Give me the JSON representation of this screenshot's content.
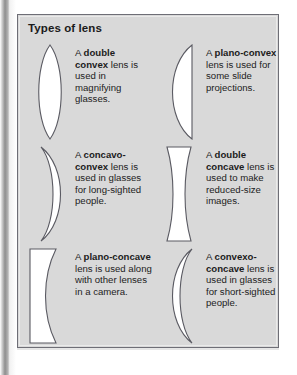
{
  "figure": {
    "title": "Types of lens",
    "background_color": "#d9d9d9",
    "border_color": "#6e6e76",
    "lens_fill_color": "#ffffff",
    "lens_outline_color": "#5a5a62",
    "text_color": "#1c1c1c"
  },
  "lenses": [
    {
      "id": "double-convex",
      "shape": "double-convex",
      "icon_name": "double-convex-lens-icon",
      "caption_lead": "A ",
      "caption_term": "double convex",
      "caption_tail": " lens is used in magnifying glasses."
    },
    {
      "id": "plano-convex",
      "shape": "plano-convex",
      "icon_name": "plano-convex-lens-icon",
      "caption_lead": "A ",
      "caption_term": "plano-convex",
      "caption_tail": " lens is used for some slide projections."
    },
    {
      "id": "concavo-convex",
      "shape": "concavo-convex",
      "icon_name": "concavo-convex-lens-icon",
      "caption_lead": "A ",
      "caption_term": "concavo-convex",
      "caption_tail": " lens is used in glasses for long-sighted people."
    },
    {
      "id": "double-concave",
      "shape": "double-concave",
      "icon_name": "double-concave-lens-icon",
      "caption_lead": "A ",
      "caption_term": "double concave",
      "caption_tail": " lens is used to make reduced-size images."
    },
    {
      "id": "plano-concave",
      "shape": "plano-concave",
      "icon_name": "plano-concave-lens-icon",
      "caption_lead": "A ",
      "caption_term": "plano-concave",
      "caption_tail": " lens is used along with other lenses in a camera."
    },
    {
      "id": "convexo-concave",
      "shape": "convexo-concave",
      "icon_name": "convexo-concave-lens-icon",
      "caption_lead": "A ",
      "caption_term": "convexo-concave",
      "caption_tail": " lens is used in glasses for short-sighted people."
    }
  ]
}
